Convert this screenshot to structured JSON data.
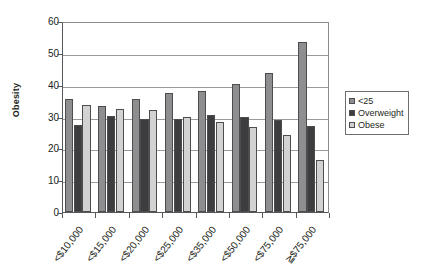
{
  "chart_data": {
    "type": "bar",
    "title": "",
    "xlabel": "",
    "ylabel": "Obesity",
    "ylim": [
      0,
      60
    ],
    "ytick_step": 10,
    "yticks": [
      0,
      10,
      20,
      30,
      40,
      50,
      60
    ],
    "grid": "horizontal",
    "legend_position": "right",
    "categories": [
      "<$10,000",
      "<$15,000",
      "<$20,000",
      "<$25,000",
      "<$35,000",
      "<$50,000",
      "<$75,000",
      "≧$75,000"
    ],
    "series": [
      {
        "name": "<25",
        "color": "#8e8e90",
        "values": [
          35.5,
          33.3,
          35.4,
          37.3,
          37.9,
          40.1,
          43.7,
          53.5
        ]
      },
      {
        "name": "Overweight",
        "color": "#3d3d3f",
        "values": [
          27.3,
          30.3,
          29.2,
          29.3,
          30.6,
          30.0,
          29.0,
          26.9
        ]
      },
      {
        "name": "Obese",
        "color": "#d2d2d2",
        "values": [
          33.5,
          32.4,
          31.9,
          29.9,
          28.2,
          26.6,
          24.1,
          16.2
        ]
      }
    ]
  },
  "legend": {
    "items": [
      {
        "label": "<25"
      },
      {
        "label": "Overweight"
      },
      {
        "label": "Obese"
      }
    ]
  },
  "axes": {
    "y_title": "Obesity"
  }
}
